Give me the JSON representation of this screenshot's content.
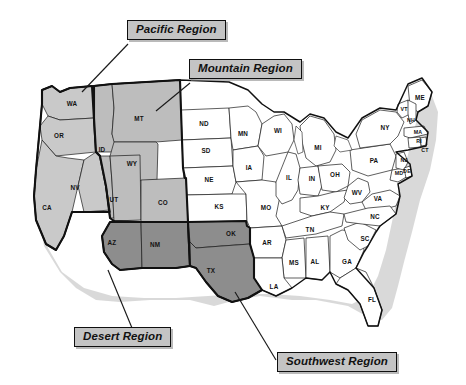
{
  "map": {
    "title": "United States Sales Regions Map",
    "callouts": [
      {
        "id": "pacific",
        "label": "Pacific Region",
        "color": "#c9c9c9"
      },
      {
        "id": "mountain",
        "label": "Mountain Region",
        "color": "#bdbdbd"
      },
      {
        "id": "desert",
        "label": "Desert Region",
        "color": "#8d8d8d"
      },
      {
        "id": "southwest",
        "label": "Southwest Region",
        "color": "#8d8d8d"
      }
    ],
    "regions": {
      "pacific": {
        "name": "Pacific Region",
        "states": [
          "WA",
          "OR",
          "CA",
          "NV"
        ]
      },
      "mountain": {
        "name": "Mountain Region",
        "states": [
          "MT",
          "ID",
          "WY",
          "UT",
          "CO"
        ]
      },
      "desert": {
        "name": "Desert Region",
        "states": [
          "AZ",
          "NM"
        ]
      },
      "southwest": {
        "name": "Southwest Region",
        "states": [
          "OK",
          "TX"
        ]
      }
    },
    "states": [
      {
        "abbr": "WA",
        "x": 72,
        "y": 104,
        "region": "pacific"
      },
      {
        "abbr": "OR",
        "x": 59,
        "y": 136,
        "region": "pacific"
      },
      {
        "abbr": "CA",
        "x": 47,
        "y": 208,
        "region": "pacific"
      },
      {
        "abbr": "NV",
        "x": 75,
        "y": 188,
        "region": "pacific"
      },
      {
        "abbr": "ID",
        "x": 102,
        "y": 150,
        "region": "mountain"
      },
      {
        "abbr": "MT",
        "x": 139,
        "y": 119,
        "region": "mountain"
      },
      {
        "abbr": "WY",
        "x": 132,
        "y": 164,
        "region": "mountain"
      },
      {
        "abbr": "UT",
        "x": 114,
        "y": 200,
        "region": "mountain"
      },
      {
        "abbr": "CO",
        "x": 163,
        "y": 203,
        "region": "mountain"
      },
      {
        "abbr": "AZ",
        "x": 112,
        "y": 243,
        "region": "desert"
      },
      {
        "abbr": "NM",
        "x": 155,
        "y": 245,
        "region": "desert"
      },
      {
        "abbr": "OK",
        "x": 231,
        "y": 234,
        "region": "southwest"
      },
      {
        "abbr": "TX",
        "x": 211,
        "y": 271,
        "region": "southwest"
      },
      {
        "abbr": "ND",
        "x": 204,
        "y": 124,
        "region": "plain"
      },
      {
        "abbr": "SD",
        "x": 206,
        "y": 151,
        "region": "plain"
      },
      {
        "abbr": "NE",
        "x": 209,
        "y": 180,
        "region": "plain"
      },
      {
        "abbr": "KS",
        "x": 219,
        "y": 207,
        "region": "plain"
      },
      {
        "abbr": "MN",
        "x": 243,
        "y": 134,
        "region": "plain"
      },
      {
        "abbr": "IA",
        "x": 249,
        "y": 168,
        "region": "plain"
      },
      {
        "abbr": "MO",
        "x": 266,
        "y": 208,
        "region": "plain"
      },
      {
        "abbr": "AR",
        "x": 267,
        "y": 243,
        "region": "plain"
      },
      {
        "abbr": "LA",
        "x": 274,
        "y": 287,
        "region": "plain"
      },
      {
        "abbr": "MS",
        "x": 294,
        "y": 263,
        "region": "plain"
      },
      {
        "abbr": "AL",
        "x": 315,
        "y": 262,
        "region": "plain"
      },
      {
        "abbr": "GA",
        "x": 347,
        "y": 262,
        "region": "plain"
      },
      {
        "abbr": "FL",
        "x": 372,
        "y": 300,
        "region": "plain"
      },
      {
        "abbr": "SC",
        "x": 365,
        "y": 239,
        "region": "plain"
      },
      {
        "abbr": "NC",
        "x": 375,
        "y": 217,
        "region": "plain"
      },
      {
        "abbr": "TN",
        "x": 310,
        "y": 230,
        "region": "plain"
      },
      {
        "abbr": "KY",
        "x": 325,
        "y": 208,
        "region": "plain"
      },
      {
        "abbr": "WI",
        "x": 278,
        "y": 131,
        "region": "plain"
      },
      {
        "abbr": "IL",
        "x": 289,
        "y": 178,
        "region": "plain"
      },
      {
        "abbr": "IN",
        "x": 312,
        "y": 179,
        "region": "plain"
      },
      {
        "abbr": "OH",
        "x": 335,
        "y": 175,
        "region": "plain"
      },
      {
        "abbr": "MI",
        "x": 318,
        "y": 148,
        "region": "plain"
      },
      {
        "abbr": "WV",
        "x": 357,
        "y": 193,
        "region": "plain"
      },
      {
        "abbr": "VA",
        "x": 378,
        "y": 199,
        "region": "plain"
      },
      {
        "abbr": "PA",
        "x": 374,
        "y": 161,
        "region": "plain"
      },
      {
        "abbr": "NY",
        "x": 385,
        "y": 128,
        "region": "plain"
      },
      {
        "abbr": "ME",
        "x": 420,
        "y": 98,
        "region": "plain"
      },
      {
        "abbr": "VT",
        "x": 404,
        "y": 110,
        "region": "plain"
      },
      {
        "abbr": "NH",
        "x": 411,
        "y": 121,
        "region": "plain"
      },
      {
        "abbr": "MA",
        "x": 418,
        "y": 133,
        "region": "plain"
      },
      {
        "abbr": "RI",
        "x": 419,
        "y": 142,
        "region": "plain"
      },
      {
        "abbr": "CT",
        "x": 425,
        "y": 151,
        "region": "plain"
      },
      {
        "abbr": "NJ",
        "x": 404,
        "y": 161,
        "region": "plain"
      },
      {
        "abbr": "MD",
        "x": 399,
        "y": 174,
        "region": "plain"
      },
      {
        "abbr": "DE",
        "x": 407,
        "y": 172,
        "region": "plain"
      }
    ]
  }
}
